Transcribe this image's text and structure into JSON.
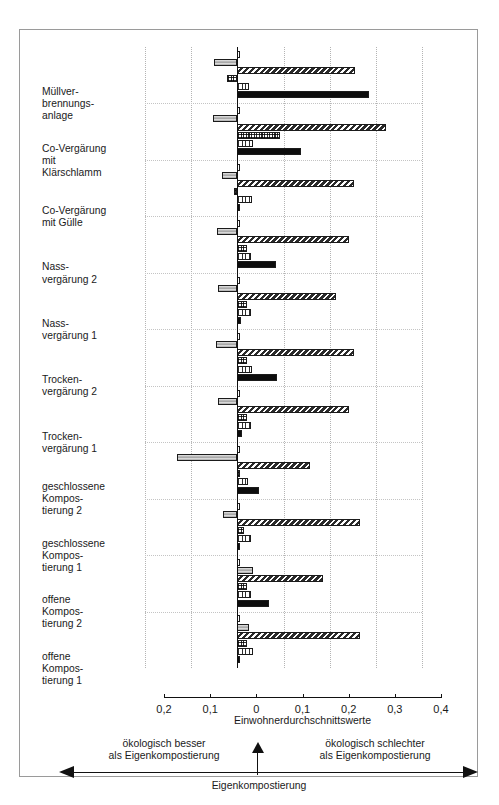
{
  "chart_data": {
    "type": "bar",
    "orientation": "horizontal",
    "title": "",
    "xlabel": "Einwohnerdurchschnittswerte",
    "ylabel": "",
    "xlim": [
      -0.2,
      0.4
    ],
    "xticks": [
      -0.2,
      -0.1,
      0,
      0.1,
      0.2,
      0.3,
      0.4
    ],
    "xticklabels": [
      "0,2",
      "0,1",
      "0",
      "0,1",
      "0,2",
      "0,3",
      "0,4"
    ],
    "grid": true,
    "legend": "none",
    "categories": [
      "Müllver-\nbrennungs-\nanlage",
      "Co-Vergärung\nmit\nKlärschlamm",
      "Co-Vergärung\nmit Gülle",
      "Nass-\nvergärung 2",
      "Nass-\nvergärung 1",
      "Trocken-\nvergärung 2",
      "Trocken-\nvergärung 1",
      "geschlossene\nKompos-\ntierung 2",
      "geschlossene\nKompos-\ntierung 1",
      "offene\nKompos-\ntierung 2",
      "offene\nKompos-\ntierung 1"
    ],
    "series": [
      {
        "name": "series-1",
        "pattern": "white",
        "values": [
          0.004,
          0.005,
          0.004,
          0.004,
          0.005,
          0.005,
          0.005,
          0.004,
          0.004,
          0.004,
          0.004
        ]
      },
      {
        "name": "series-2",
        "pattern": "gray",
        "values": [
          -0.05,
          -0.052,
          -0.034,
          -0.045,
          -0.042,
          -0.046,
          -0.042,
          -0.13,
          -0.03,
          0.033,
          0.026
        ]
      },
      {
        "name": "series-3",
        "pattern": "diagonal-hatch",
        "values": [
          0.255,
          0.322,
          0.252,
          0.241,
          0.213,
          0.252,
          0.242,
          0.158,
          0.265,
          0.185,
          0.265
        ]
      },
      {
        "name": "series-4",
        "pattern": "checker",
        "values": [
          -0.022,
          0.092,
          -0.008,
          0.02,
          0.02,
          0.021,
          0.02,
          0.004,
          0.014,
          0.02,
          0.02
        ]
      },
      {
        "name": "series-5",
        "pattern": "vertical-stripe",
        "values": [
          0.025,
          0.035,
          0.032,
          0.03,
          0.029,
          0.031,
          0.03,
          0.023,
          0.03,
          0.029,
          0.033
        ]
      },
      {
        "name": "series-6",
        "pattern": "black",
        "values": [
          0.285,
          0.137,
          0.0,
          0.084,
          0.009,
          0.086,
          0.01,
          0.048,
          0.005,
          0.069,
          0.002
        ]
      }
    ],
    "negative_overlays": [
      {
        "group": 0,
        "series": 3,
        "value": -0.022
      },
      {
        "group": 2,
        "series": 3,
        "value": -0.008
      }
    ]
  },
  "axis": {
    "title": "Einwohnerdurchschnittswerte"
  },
  "annotation": {
    "left": "ökologisch besser\nals Eigenkompostierung",
    "right": "ökologisch schlechter\nals Eigenkompostierung",
    "center": "Eigenkompostierung"
  },
  "colors": {
    "axis": "#111111",
    "grid": "#b4b4b4",
    "frame": "#9a9a9a",
    "bar_gray": "#c4c4c4",
    "bar_black": "#0d0d0d",
    "text": "#1a1a1a"
  }
}
